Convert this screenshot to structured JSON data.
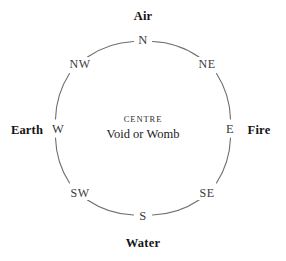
{
  "diagram": {
    "background_color": "#ffffff",
    "ring": {
      "stroke_color": "#6e6e6e",
      "stroke_width": 1.1,
      "center_x": 143,
      "center_y": 128,
      "radius": 88
    },
    "centre": {
      "title": "CENTRE",
      "subtitle": "Void or Womb"
    },
    "elements": [
      {
        "key": "air",
        "label": "Air",
        "position": "top",
        "x": 143,
        "y": 16
      },
      {
        "key": "fire",
        "label": "Fire",
        "position": "right",
        "x": 259,
        "y": 130
      },
      {
        "key": "water",
        "label": "Water",
        "position": "bottom",
        "x": 143,
        "y": 243
      },
      {
        "key": "earth",
        "label": "Earth",
        "position": "left",
        "x": 27,
        "y": 130
      }
    ],
    "points": [
      {
        "key": "n",
        "label": "N",
        "kind": "cardinal",
        "x": 143,
        "y": 40
      },
      {
        "key": "ne",
        "label": "NE",
        "kind": "intercardinal",
        "x": 207,
        "y": 64
      },
      {
        "key": "e",
        "label": "E",
        "kind": "cardinal",
        "x": 230,
        "y": 129
      },
      {
        "key": "se",
        "label": "SE",
        "kind": "intercardinal",
        "x": 207,
        "y": 193
      },
      {
        "key": "s",
        "label": "S",
        "kind": "cardinal",
        "x": 143,
        "y": 216
      },
      {
        "key": "sw",
        "label": "SW",
        "kind": "intercardinal",
        "x": 80,
        "y": 193
      },
      {
        "key": "w",
        "label": "W",
        "kind": "cardinal",
        "x": 58,
        "y": 129
      },
      {
        "key": "nw",
        "label": "NW",
        "kind": "intercardinal",
        "x": 80,
        "y": 64
      }
    ]
  }
}
